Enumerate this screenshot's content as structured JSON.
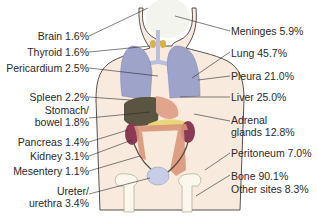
{
  "diagram": {
    "type": "anatomical figure with metastasis site labels",
    "colors": {
      "skin": "#f8ebdd",
      "outline": "#2a2a2a",
      "lung": "#9da3c9",
      "liver": "#5a5540",
      "stomach": "#e0a58c",
      "intestine": "#d9967a",
      "kidney": "#8a3a55",
      "bone": "#fbf7ec",
      "bladder": "#c7cde6",
      "pancreas": "#e8d77a",
      "thyroid": "#d8b24a"
    },
    "left_labels": [
      {
        "text": "Brain 1.6%"
      },
      {
        "text": "Thyroid 1.6%"
      },
      {
        "text": "Pericardium 2.5%"
      },
      {
        "text": "Spleen 2.2%"
      },
      {
        "line1": "Stomach/",
        "line2": "bowel 1.8%"
      },
      {
        "text": "Pancreas 1.4%"
      },
      {
        "text": "Kidney 3.1%"
      },
      {
        "text": "Mesentery 1.1%"
      },
      {
        "line1": "Ureter/",
        "line2": "urethra 3.4%"
      }
    ],
    "right_labels": [
      {
        "text": "Meninges 5.9%"
      },
      {
        "text": "Lung 45.7%"
      },
      {
        "text": "Pleura 21.0%"
      },
      {
        "text": "Liver 25.0%"
      },
      {
        "line1": "Adrenal",
        "line2": "glands 12.8%"
      },
      {
        "text": "Peritoneum 7.0%"
      },
      {
        "line1": "Bone 90.1%",
        "line2": "Other sites 8.3%"
      }
    ]
  }
}
